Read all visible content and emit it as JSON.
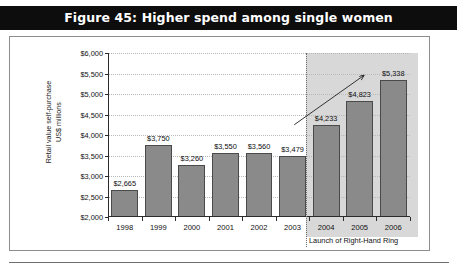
{
  "figure": {
    "title": "Figure 45: Higher spend among single women"
  },
  "chart_data": {
    "type": "bar",
    "title": "Figure 45: Higher spend among single women",
    "xlabel": "",
    "ylabel": "Retail value self-purchase\nUS$ millions",
    "categories": [
      "1998",
      "1999",
      "2000",
      "2001",
      "2002",
      "2003",
      "2004",
      "2005",
      "2006"
    ],
    "values": [
      2665,
      3750,
      3260,
      3550,
      3560,
      3479,
      4233,
      4823,
      5338
    ],
    "value_labels": [
      "$2,665",
      "$3,750",
      "$3,260",
      "$3,550",
      "$3,560",
      "$3,479",
      "$4,233",
      "$4,823",
      "$5,338"
    ],
    "ylim": [
      2000,
      6000
    ],
    "ytick_labels": [
      "$2,000",
      "$2,500",
      "$3,000",
      "$3,500",
      "$4,000",
      "$4,500",
      "$5,000",
      "$5,500",
      "$6,000"
    ],
    "ytick_values": [
      2000,
      2500,
      3000,
      3500,
      4000,
      4500,
      5000,
      5500,
      6000
    ],
    "grid": true,
    "legend": false,
    "series_color": "#8a8a8a",
    "annotations": [
      {
        "name": "launch-note",
        "text": "Launch of Right-Hand Ring",
        "at_category": "2004"
      },
      {
        "name": "trend-arrow",
        "text": "",
        "from_category": "2003",
        "to_category": "2005"
      }
    ],
    "highlight_band": {
      "from_category": "2004",
      "to_category": "2006",
      "color": "#c9c9c9"
    }
  }
}
